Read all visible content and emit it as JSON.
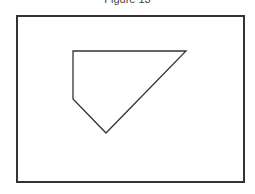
{
  "figure": {
    "title": "Figure 13",
    "frame_color": "#333333",
    "shape": {
      "type": "polygon",
      "name": "pentagon",
      "stroke": "#333333",
      "fill": "none",
      "points": [
        [
          73,
          51
        ],
        [
          186,
          51
        ],
        [
          106,
          133
        ],
        [
          73,
          99
        ]
      ]
    }
  }
}
